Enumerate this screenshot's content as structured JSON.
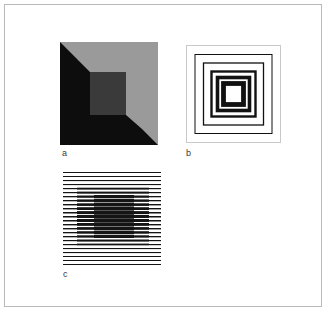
{
  "page": {
    "width": 334,
    "height": 323,
    "background_color": "#ffffff",
    "frame_color": "#b9b9b9",
    "frame_inset_px": 4
  },
  "figure": {
    "panel_count": 3,
    "panels": [
      {
        "id": "a",
        "label": "a",
        "name": "albers-nested-squares",
        "description": "Nested squares with mitred diagonal corners producing a tunnel / bevel percept",
        "x": 60,
        "y": 42,
        "width": 98,
        "height": 103,
        "bands": [
          {
            "name": "outer-band",
            "fill": "#9a9a9a"
          },
          {
            "name": "middle-band",
            "fill": "#0d0d0d"
          },
          {
            "name": "inner-square",
            "fill": "#3a3a3a"
          }
        ],
        "shading": {
          "top_left_light": "#9a9a9a",
          "top_left_dark": "#0d0d0d",
          "bottom_right_light": "#9a9a9a",
          "bottom_right_dark": "#0d0d0d"
        },
        "ring_insets_px": [
          0,
          16,
          30
        ]
      },
      {
        "id": "b",
        "label": "b",
        "name": "concentric-square-outlines",
        "description": "Concentric square outlines on white, stroke weight increasing toward the centre",
        "x": 186,
        "y": 45,
        "width": 95,
        "height": 98,
        "background": "#ffffff",
        "border_color": "#c9c9c9",
        "stroke_color": "#111111",
        "rings": [
          {
            "index": 1,
            "inset": 9,
            "stroke_width": 1.0
          },
          {
            "index": 2,
            "inset": 18,
            "stroke_width": 1.2
          },
          {
            "index": 3,
            "inset": 26,
            "stroke_width": 2.2
          },
          {
            "index": 4,
            "inset": 32,
            "stroke_width": 3.4
          },
          {
            "index": 5,
            "inset": 38,
            "stroke_width": 4.6
          }
        ],
        "core_fill": "#ffffff"
      },
      {
        "id": "c",
        "label": "c",
        "name": "line-grating-square",
        "description": "Horizontal line grating; lines thicken inside a central square region producing an illusory dark square",
        "x": 63,
        "y": 171,
        "width": 98,
        "height": 95,
        "line_color": "#141414",
        "line_count": 24,
        "line_spacing_px": 4,
        "outer_line_weight_px": 1.0,
        "center_line_weight_px": 3.6,
        "center_region": {
          "x": 31,
          "y": 22,
          "width": 40,
          "height": 50
        },
        "mid_region": {
          "x": 14,
          "y": 13,
          "width": 72,
          "height": 68
        }
      }
    ]
  }
}
